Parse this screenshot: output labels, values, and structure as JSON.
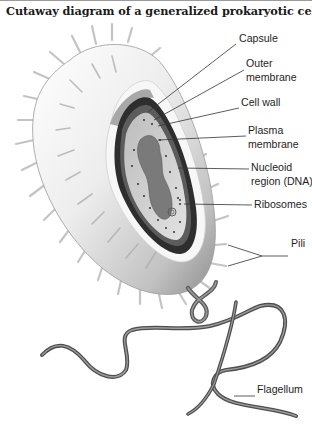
{
  "figure": {
    "title": "Cutaway diagram of a generalized prokaryotic cell."
  },
  "labels": {
    "capsule": "Capsule",
    "outer_membrane_line1": "Outer",
    "outer_membrane_line2": "membrane",
    "cell_wall": "Cell wall",
    "plasma_membrane_line1": "Plasma",
    "plasma_membrane_line2": "membrane",
    "nucleoid_line1": "Nucleoid",
    "nucleoid_line2": "region (DNA)",
    "ribosomes": "Ribosomes",
    "pili": "Pili",
    "flagellum": "Flagellum"
  },
  "colors": {
    "capsule_light": "#f4f4f4",
    "capsule_shade": "#b8b8b8",
    "cell_wall_dark": "#2e2e2e",
    "cytoplasm": "#d6d6d6",
    "nucleoid": "#7a7a7a",
    "flagellum": "#6a6a6a",
    "leader_line": "#333333"
  }
}
